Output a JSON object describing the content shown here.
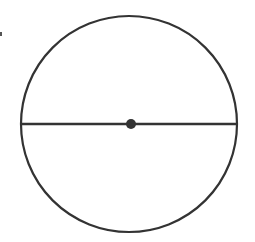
{
  "diagram": {
    "type": "circle-with-diameter",
    "canvas": {
      "width": 255,
      "height": 242,
      "background": "#ffffff"
    },
    "stroke_color": "#333333",
    "circle": {
      "cx": 129,
      "cy": 124,
      "r": 108,
      "stroke_width": 2.2
    },
    "diameter": {
      "x1": 21,
      "y1": 124,
      "x2": 237,
      "y2": 124,
      "stroke_width": 2.4
    },
    "center_point": {
      "cx": 131,
      "cy": 124,
      "r": 5
    },
    "edge_mark": {
      "x": 0,
      "y": 32,
      "width": 2,
      "height": 4
    }
  }
}
